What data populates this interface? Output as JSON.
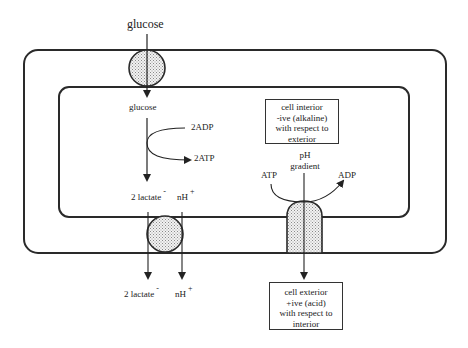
{
  "diagram": {
    "colors": {
      "line": "#2a2a2a",
      "fill_stipple": "#d8d8d8",
      "background": "#ffffff"
    },
    "labels": {
      "glucose_outside": "glucose",
      "glucose_inside": "glucose",
      "adp_in": "2ADP",
      "atp_out": "2ATP",
      "lactate_inside": "2 lactate",
      "lactate_inside_charge": "-",
      "proton_inside": "nH",
      "proton_inside_charge": "+",
      "lactate_outside": "2 lactate",
      "lactate_outside_charge": "-",
      "proton_outside": "nH",
      "proton_outside_charge": "+",
      "ph_gradient_line1": "pH",
      "ph_gradient_line2": "gradient",
      "pump_atp": "ATP",
      "pump_adp": "ADP"
    },
    "interior_box": {
      "lines": [
        "cell interior",
        "-ive (alkaline)",
        "with respect to",
        "exterior"
      ]
    },
    "exterior_box": {
      "lines": [
        "cell exterior",
        "+ive (acid)",
        "with respect to",
        "interior"
      ]
    },
    "components": [
      "outer-membrane",
      "inner-membrane",
      "glucose-transporter",
      "lactate-proton-symporter",
      "atp-driven-proton-pump"
    ]
  }
}
